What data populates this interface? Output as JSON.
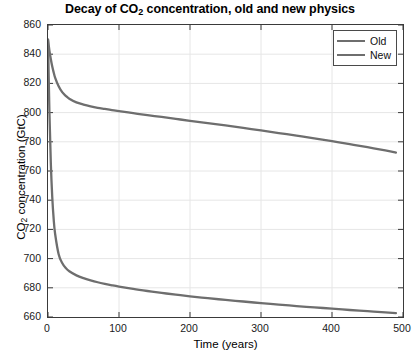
{
  "chart_data": {
    "type": "line",
    "title": "Decay of CO2 concentration, old and new physics",
    "title_prefix": "Decay of CO",
    "title_sub": "2",
    "title_suffix": " concentration, old and new physics",
    "xlabel": "Time (years)",
    "ylabel_prefix": "CO",
    "ylabel_sub": "2",
    "ylabel_suffix": " concentration (GtC)",
    "ylabel": "CO2 concentration (GtC)",
    "xlim": [
      0,
      500
    ],
    "ylim": [
      660,
      860
    ],
    "xticks": [
      0,
      100,
      200,
      300,
      400,
      500
    ],
    "yticks": [
      660,
      680,
      700,
      720,
      740,
      760,
      780,
      800,
      820,
      840,
      860
    ],
    "grid": true,
    "legend_position": "top-right",
    "x": [
      0,
      2,
      4,
      6,
      8,
      10,
      15,
      20,
      25,
      30,
      40,
      50,
      60,
      70,
      80,
      90,
      100,
      120,
      140,
      160,
      180,
      200,
      225,
      250,
      275,
      300,
      325,
      350,
      375,
      400,
      425,
      450,
      475,
      490
    ],
    "series": [
      {
        "name": "Old",
        "color": "#6e6e6e",
        "values": [
          850,
          842.5,
          836.5,
          831.5,
          827.5,
          824,
          818,
          814,
          811.5,
          809.5,
          807,
          805.5,
          804.3,
          803.3,
          802.5,
          801.7,
          801,
          799.6,
          798.3,
          797,
          795.7,
          794.4,
          792.8,
          791.2,
          789.5,
          787.8,
          786,
          784.2,
          782.3,
          780.4,
          778.4,
          776.3,
          774.1,
          772.6
        ]
      },
      {
        "name": "New",
        "color": "#6e6e6e",
        "values": [
          850,
          800,
          765,
          742,
          727,
          717,
          703,
          697,
          693.5,
          691.3,
          688.5,
          686.6,
          685.1,
          683.8,
          682.7,
          681.7,
          680.8,
          679.2,
          677.8,
          676.5,
          675.3,
          674.2,
          672.9,
          671.7,
          670.6,
          669.5,
          668.5,
          667.5,
          666.6,
          665.7,
          664.8,
          664,
          663.2,
          662.7
        ]
      }
    ],
    "legend": [
      {
        "label": "Old",
        "color": "#6e6e6e"
      },
      {
        "label": "New",
        "color": "#6e6e6e"
      }
    ],
    "axis_color": "#3a3a3a",
    "grid_color": "#e6e6e6",
    "background": "#ffffff"
  }
}
